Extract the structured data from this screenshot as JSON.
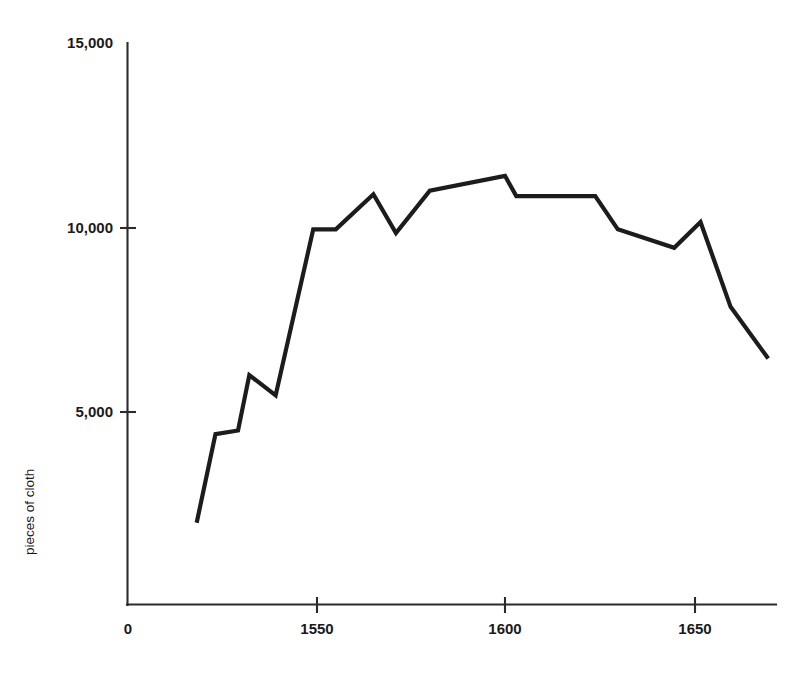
{
  "chart_data": {
    "type": "line",
    "title": "",
    "subtitle": "",
    "xlabel": "",
    "ylabel": "pieces of cloth",
    "xlim": [
      1500,
      1672
    ],
    "ylim": [
      0,
      15000
    ],
    "grid": false,
    "legend": null,
    "x_ticks": [
      {
        "label": "0",
        "value": 1500,
        "has_mark": false
      },
      {
        "label": "1550",
        "value": 1550,
        "has_mark": true
      },
      {
        "label": "1600",
        "value": 1600,
        "has_mark": true
      },
      {
        "label": "1650",
        "value": 1650,
        "has_mark": true
      }
    ],
    "y_ticks": [
      {
        "label": "15,000",
        "value": 15000,
        "has_mark": false
      },
      {
        "label": "10,000",
        "value": 10000,
        "has_mark": true
      },
      {
        "label": "5,000",
        "value": 5000,
        "has_mark": true
      }
    ],
    "series": [
      {
        "name": "pieces of cloth",
        "color": "#1c1c1c",
        "x": [
          1518,
          1523,
          1529,
          1532,
          1539,
          1549,
          1555,
          1565,
          1571,
          1580,
          1600,
          1603,
          1624,
          1630,
          1645,
          1652,
          1660,
          1670
        ],
        "values": [
          2000,
          4400,
          4500,
          6000,
          5450,
          9950,
          9950,
          10900,
          9850,
          11000,
          11400,
          10850,
          10850,
          9950,
          9450,
          10150,
          7850,
          6450
        ]
      }
    ],
    "annotations": []
  },
  "axis": {
    "y_title": "pieces of cloth"
  }
}
